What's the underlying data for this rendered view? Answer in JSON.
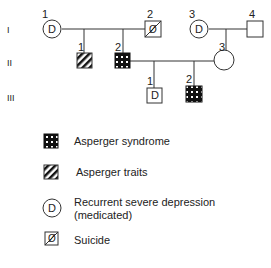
{
  "pedigree": {
    "generations": [
      "I",
      "II",
      "III"
    ],
    "individuals": [
      {
        "id": "I-1",
        "number": "1",
        "sex": "female",
        "marker": "D",
        "status": "depression"
      },
      {
        "id": "I-2",
        "number": "2",
        "sex": "male",
        "marker": "Ø",
        "status": "suicide"
      },
      {
        "id": "I-3",
        "number": "3",
        "sex": "female",
        "marker": "D",
        "status": "depression"
      },
      {
        "id": "I-4",
        "number": "4",
        "sex": "male",
        "marker": "",
        "status": "unaffected"
      },
      {
        "id": "II-1",
        "number": "1",
        "sex": "male",
        "marker": "",
        "status": "asperger-traits"
      },
      {
        "id": "II-2",
        "number": "2",
        "sex": "male",
        "marker": "",
        "status": "asperger-syndrome"
      },
      {
        "id": "II-3",
        "number": "3",
        "sex": "female",
        "marker": "",
        "status": "unaffected"
      },
      {
        "id": "III-1",
        "number": "1",
        "sex": "male",
        "marker": "D",
        "status": "depression"
      },
      {
        "id": "III-2",
        "number": "2",
        "sex": "male",
        "marker": "",
        "status": "asperger-syndrome"
      }
    ]
  },
  "legend": {
    "items": [
      {
        "symbol": "dotted-square",
        "label": "Asperger syndrome"
      },
      {
        "symbol": "hatched-square",
        "label": "Asperger traits"
      },
      {
        "symbol": "circle-D",
        "label": "Recurrent severe depression",
        "label2": "(medicated)"
      },
      {
        "symbol": "square-slash",
        "label": "Suicide"
      }
    ]
  },
  "glyphs": {
    "D": "D",
    "slash": "Ø"
  }
}
